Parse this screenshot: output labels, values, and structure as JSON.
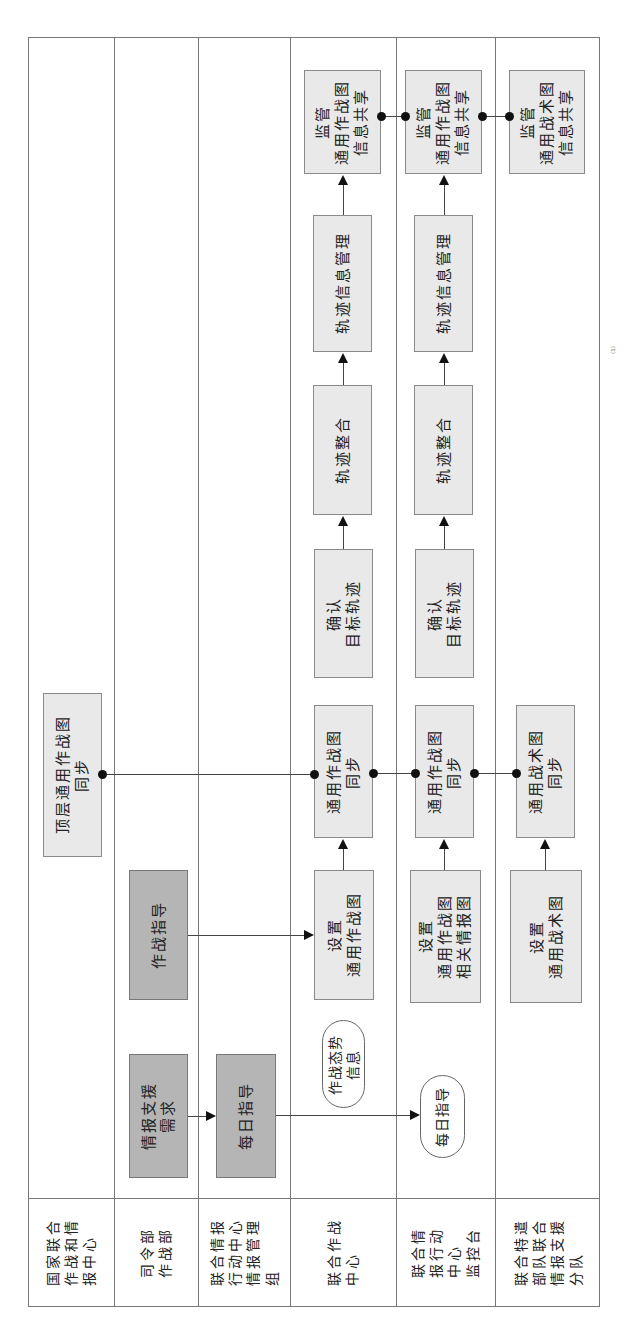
{
  "diagram": {
    "orientation": "rotated 90° counter-clockwise (lanes run vertically, flow goes upward)",
    "lanes": [
      {
        "id": "lane1",
        "label": "国家联合\n作战和情\n报中心"
      },
      {
        "id": "lane2",
        "label": "司令部\n作战部"
      },
      {
        "id": "lane3",
        "label": "联合情报\n行动中心\n情报管理\n组"
      },
      {
        "id": "lane4",
        "label": "联合作战\n中心"
      },
      {
        "id": "lane5",
        "label": "联合情\n报行动\n中心\n监控台"
      },
      {
        "id": "lane6",
        "label": "联合特遣\n部队联合\n情报支援\n分队"
      }
    ],
    "nodes": {
      "top_cop_sync": "顶层通用作战图\n同步",
      "intel_support_req": "情报支援\n需求",
      "ops_guidance": "作战指导",
      "daily_guidance": "每日指导",
      "ops_situation_info": "作战态势\n信息",
      "daily_guidance_oval": "每日指导",
      "jocc_setup_cop": "设置\n通用作战图",
      "jocc_cop_sync": "通用作战图\n同步",
      "jocc_confirm_track": "确认\n目标轨迹",
      "jocc_track_integration": "轨迹整合",
      "jocc_track_info_mgmt": "轨迹信息管理",
      "jocc_monitor_cop_share": "监管\n通用作战图\n信息共享",
      "jioc_setup_cop_intel": "设置\n通用作战图\n相关情报图",
      "jioc_cop_sync": "通用作战图\n同步",
      "jioc_confirm_track": "确认\n目标轨迹",
      "jioc_track_integration": "轨迹整合",
      "jioc_track_info_mgmt": "轨迹信息管理",
      "jioc_monitor_cop_share": "监管\n通用作战图\n信息共享",
      "jtf_setup_ctp": "设置\n通用战术图",
      "jtf_ctp_sync": "通用战术图\n同步",
      "jtf_monitor_ctp_share": "监管\n通用战术图\n信息共享"
    },
    "edges": [
      {
        "from": "intel_support_req",
        "to": "daily_guidance",
        "type": "arrow"
      },
      {
        "from": "daily_guidance",
        "to": "daily_guidance_oval",
        "type": "arrow"
      },
      {
        "from": "ops_guidance",
        "to": "jocc_setup_cop",
        "type": "arrow"
      },
      {
        "from": "jocc_setup_cop",
        "to": "jocc_cop_sync",
        "type": "arrow"
      },
      {
        "from": "jioc_setup_cop_intel",
        "to": "jioc_cop_sync",
        "type": "arrow"
      },
      {
        "from": "jtf_setup_ctp",
        "to": "jtf_ctp_sync",
        "type": "arrow"
      },
      {
        "from": "top_cop_sync",
        "to": "jocc_cop_sync",
        "type": "dot-connector"
      },
      {
        "from": "jocc_cop_sync",
        "to": "jioc_cop_sync",
        "type": "dot-connector"
      },
      {
        "from": "jioc_cop_sync",
        "to": "jtf_ctp_sync",
        "type": "dot-connector"
      },
      {
        "from": "jocc_confirm_track",
        "to": "jocc_track_integration",
        "type": "arrow"
      },
      {
        "from": "jocc_track_integration",
        "to": "jocc_track_info_mgmt",
        "type": "arrow"
      },
      {
        "from": "jocc_track_info_mgmt",
        "to": "jocc_monitor_cop_share",
        "type": "arrow"
      },
      {
        "from": "jioc_confirm_track",
        "to": "jioc_track_integration",
        "type": "arrow"
      },
      {
        "from": "jioc_track_integration",
        "to": "jioc_track_info_mgmt",
        "type": "arrow"
      },
      {
        "from": "jioc_track_info_mgmt",
        "to": "jioc_monitor_cop_share",
        "type": "arrow"
      },
      {
        "from": "jocc_monitor_cop_share",
        "to": "jioc_monitor_cop_share",
        "type": "dot-connector"
      },
      {
        "from": "jioc_monitor_cop_share",
        "to": "jtf_monitor_ctp_share",
        "type": "dot-connector"
      }
    ],
    "colors": {
      "dark_box": "#b5b5b5",
      "light_box": "#e9e9e9",
      "border": "#777777",
      "connector": "#111111"
    },
    "page_mark": "⁽¹⁾"
  }
}
